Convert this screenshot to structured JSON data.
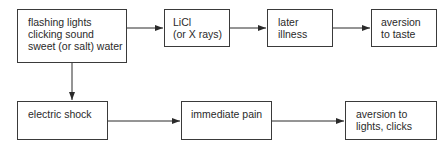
{
  "diagram": {
    "top_row": [
      {
        "id": "stimuli",
        "lines": [
          "flashing lights",
          "clicking sound",
          "sweet (or salt) water"
        ]
      },
      {
        "id": "licl",
        "lines": [
          "LiCl",
          "(or X rays)"
        ]
      },
      {
        "id": "later-illness",
        "lines": [
          "later",
          "illness"
        ]
      },
      {
        "id": "aversion-taste",
        "lines": [
          "aversion",
          "to taste"
        ]
      }
    ],
    "bottom_row": [
      {
        "id": "electric-shock",
        "lines": [
          "electric shock"
        ]
      },
      {
        "id": "immediate-pain",
        "lines": [
          "immediate pain"
        ]
      },
      {
        "id": "aversion-lights",
        "lines": [
          "aversion to",
          "lights, clicks"
        ]
      }
    ],
    "arrows": [
      {
        "from": "stimuli",
        "to": "licl"
      },
      {
        "from": "licl",
        "to": "later-illness"
      },
      {
        "from": "later-illness",
        "to": "aversion-taste"
      },
      {
        "from": "stimuli",
        "to": "electric-shock"
      },
      {
        "from": "electric-shock",
        "to": "immediate-pain"
      },
      {
        "from": "immediate-pain",
        "to": "aversion-lights"
      }
    ]
  }
}
